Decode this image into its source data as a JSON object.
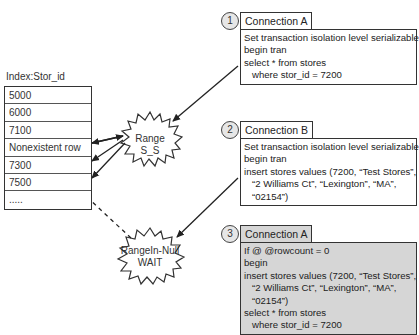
{
  "index": {
    "title": "Index:Stor_id",
    "rows": [
      "5000",
      "6000",
      "7100",
      "Nonexistent row",
      "7300",
      "7500",
      "....."
    ]
  },
  "locks": {
    "range_ss": "Range S_S",
    "rangein_null_line1": "RangeIn-Null",
    "rangein_null_line2": "WAIT"
  },
  "steps": [
    {
      "number": "1",
      "title": "Connection A",
      "code": "Set transaction isolation level serializable\nbegin tran\nselect * from stores\n   where stor_id = 7200",
      "shaded": false
    },
    {
      "number": "2",
      "title": "Connection B",
      "code": "Set transaction isolation level serializable\nbegin tran\ninsert stores values (7200, “Test Stores”,\n   “2 Williams Ct”, “Lexington”, “MA”,\n   “02154”)",
      "shaded": false
    },
    {
      "number": "3",
      "title": "Connection A",
      "code": "If @ @rowcount = 0\nbegin\ninsert stores values (7200, “Test Stores”,\n   “2 Williams Ct”, “Lexington”, “MA”,\n   “02154”)\nselect * from stores\n   where stor_id = 7200",
      "shaded": true
    }
  ],
  "colors": {
    "line": "#333333",
    "shaded_box": "#d6d6d6",
    "circle_fill": "#e6e6e6"
  }
}
